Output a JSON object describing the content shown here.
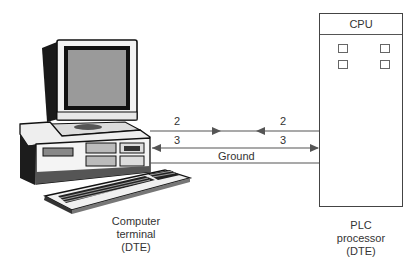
{
  "diagram": {
    "plc": {
      "header": "CPU",
      "caption_lines": [
        "PLC",
        "processor",
        "(DTE)"
      ]
    },
    "computer": {
      "caption_lines": [
        "Computer",
        "terminal",
        "(DTE)"
      ]
    },
    "connections": [
      {
        "name": "line-2",
        "left_label": "2",
        "right_label": "2",
        "description": "transmit lines crossing, arrows meeting in middle"
      },
      {
        "name": "line-3",
        "left_label": "3",
        "right_label": "3",
        "description": "double-headed arrow between terminal and PLC"
      },
      {
        "name": "ground",
        "label": "Ground"
      }
    ],
    "colors": {
      "line": "#555555",
      "box": "#444444",
      "text": "#333333"
    }
  }
}
